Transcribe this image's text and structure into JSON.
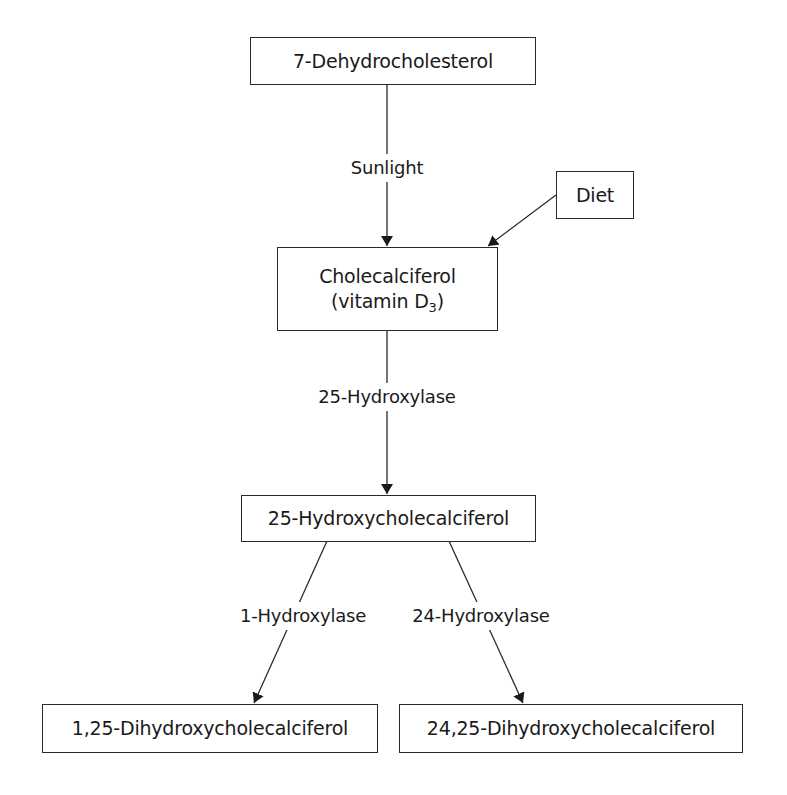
{
  "diagram": {
    "type": "biochemical-pathway",
    "nodes": {
      "dehydrocholesterol": {
        "label": "7-Dehydrocholesterol"
      },
      "diet": {
        "label": "Diet"
      },
      "cholecalciferol": {
        "line1": "Cholecalciferol",
        "line2_prefix": "(vitamin D",
        "line2_sub": "3",
        "line2_suffix": ")"
      },
      "hydroxycholecalciferol": {
        "label": "25-Hydroxycholecalciferol"
      },
      "dihydroxy_1_25": {
        "label": "1,25-Dihydroxycholecalciferol"
      },
      "dihydroxy_24_25": {
        "label": "24,25-Dihydroxycholecalciferol"
      }
    },
    "edges": [
      {
        "from": "dehydrocholesterol",
        "to": "cholecalciferol",
        "label": "Sunlight"
      },
      {
        "from": "diet",
        "to": "cholecalciferol",
        "label": ""
      },
      {
        "from": "cholecalciferol",
        "to": "hydroxycholecalciferol",
        "label": "25-Hydroxylase"
      },
      {
        "from": "hydroxycholecalciferol",
        "to": "dihydroxy_1_25",
        "label": "1-Hydroxylase"
      },
      {
        "from": "hydroxycholecalciferol",
        "to": "dihydroxy_24_25",
        "label": "24-Hydroxylase"
      }
    ],
    "colors": {
      "line": "#2a2a2a",
      "text": "#1a1a1a",
      "background": "#ffffff"
    }
  }
}
